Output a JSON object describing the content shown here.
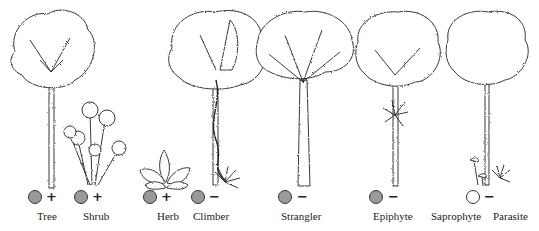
{
  "figure": {
    "colors": {
      "filled_marker": "#9a9a9a",
      "empty_marker": "#ffffff",
      "ink": "#222222"
    },
    "life_forms": [
      {
        "name": "Tree",
        "marker": "filled",
        "sign": "+",
        "label_x": 37,
        "marker_x": 28,
        "sign_x": 46
      },
      {
        "name": "Shrub",
        "marker": "filled",
        "sign": "+",
        "label_x": 83,
        "marker_x": 74,
        "sign_x": 92
      },
      {
        "name": "Herb",
        "marker": "filled",
        "sign": "+",
        "label_x": 157,
        "marker_x": 143,
        "sign_x": 161
      },
      {
        "name": "Climber",
        "marker": "filled",
        "sign": "−",
        "label_x": 193,
        "marker_x": 191,
        "sign_x": 209
      },
      {
        "name": "Strangler",
        "marker": "filled",
        "sign": "−",
        "label_x": 281,
        "marker_x": 278,
        "sign_x": 297
      },
      {
        "name": "Epiphyte",
        "marker": "filled",
        "sign": "−",
        "label_x": 373,
        "marker_x": 369,
        "sign_x": 388
      },
      {
        "name": "Saprophyte",
        "marker": "empty",
        "sign": "−",
        "label_x": 431,
        "marker_x": 466,
        "sign_x": 484
      },
      {
        "name": "Parasite",
        "marker": "none",
        "sign": "",
        "label_x": 493,
        "marker_x": 0,
        "sign_x": 0
      }
    ]
  }
}
